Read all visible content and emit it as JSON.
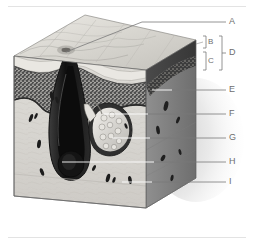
{
  "figure": {
    "background_color": "#ffffff",
    "label_color": "#6e6e6e",
    "leader_color_dark": "#7a7a7a",
    "leader_color_light": "#ffffff"
  },
  "labels": [
    {
      "id": "A",
      "text": "A",
      "x": 231,
      "y": 18,
      "target_x": 92,
      "target_y": 52,
      "kind": "leader"
    },
    {
      "id": "B",
      "text": "B",
      "x": 212,
      "y": 41,
      "kind": "bracket"
    },
    {
      "id": "C",
      "text": "C",
      "x": 212,
      "y": 58,
      "kind": "bracket"
    },
    {
      "id": "D",
      "text": "D",
      "x": 231,
      "y": 50,
      "kind": "bracket"
    },
    {
      "id": "E",
      "text": "E",
      "x": 231,
      "y": 86,
      "target_x": 157,
      "target_y": 90,
      "kind": "leader"
    },
    {
      "id": "F",
      "text": "F",
      "x": 231,
      "y": 110,
      "target_x": 108,
      "target_y": 114,
      "kind": "leader"
    },
    {
      "id": "G",
      "text": "G",
      "x": 231,
      "y": 134,
      "target_x": 106,
      "target_y": 140,
      "kind": "leader"
    },
    {
      "id": "H",
      "text": "H",
      "x": 231,
      "y": 159,
      "target_x": 58,
      "target_y": 162,
      "kind": "leader"
    },
    {
      "id": "I",
      "text": "I",
      "x": 231,
      "y": 178,
      "target_x": 145,
      "target_y": 182,
      "kind": "leader"
    }
  ],
  "brackets": {
    "inner_b": {
      "top": 36,
      "bottom": 48,
      "x": 205
    },
    "inner_c": {
      "top": 52,
      "bottom": 70,
      "x": 205
    },
    "outer_d": {
      "top": 36,
      "bottom": 70,
      "x": 220
    }
  },
  "colors": {
    "top_surface": "#cfcdc8",
    "top_surface_light": "#e6e4df",
    "front_face": "#d9d7d2",
    "right_face": "#8a8a8a",
    "right_face_dark": "#6d6d6d",
    "epidermis_dark": "#3a3a3a",
    "epidermis_stipple": "#4a4a4a",
    "hair_shaft": "#1a1a1a",
    "gland": "#bdbbb6",
    "outline": "#555555",
    "shadow": "#c8c8c8"
  }
}
